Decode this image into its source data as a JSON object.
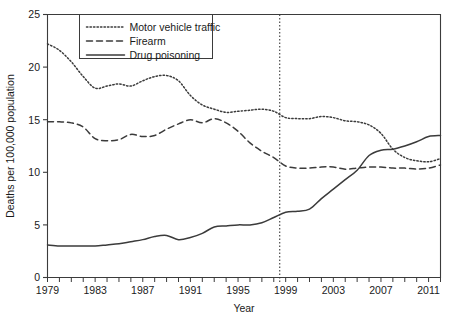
{
  "chart_data": {
    "type": "line",
    "title": "",
    "xlabel": "Year",
    "ylabel": "Deaths per 100,000 population",
    "xlim": [
      1979,
      2012
    ],
    "ylim": [
      0,
      25
    ],
    "yticks": [
      0,
      5,
      10,
      15,
      20,
      25
    ],
    "xticks": [
      1979,
      1983,
      1987,
      1991,
      1995,
      1999,
      2003,
      2007,
      2011
    ],
    "xtick_minor_step": 1,
    "grid": false,
    "legend_position": "top-left-inside",
    "annotations": [
      {
        "type": "vertical-reference-line",
        "x": 1998.5,
        "style": "dotted",
        "label": ""
      }
    ],
    "x": [
      1979,
      1980,
      1981,
      1982,
      1983,
      1984,
      1985,
      1986,
      1987,
      1988,
      1989,
      1990,
      1991,
      1992,
      1993,
      1994,
      1995,
      1996,
      1997,
      1998,
      1999,
      2000,
      2001,
      2002,
      2003,
      2004,
      2005,
      2006,
      2007,
      2008,
      2009,
      2010,
      2011,
      2012
    ],
    "series": [
      {
        "name": "Motor vehicle traffic",
        "style": "dotted",
        "values": [
          22.2,
          21.6,
          20.5,
          19.1,
          18.0,
          18.2,
          18.4,
          18.2,
          18.7,
          19.1,
          19.2,
          18.7,
          17.3,
          16.4,
          16.0,
          15.7,
          15.8,
          15.9,
          16.0,
          15.8,
          15.2,
          15.1,
          15.1,
          15.3,
          15.2,
          14.9,
          14.8,
          14.5,
          13.7,
          12.2,
          11.4,
          11.1,
          11.0,
          11.3
        ]
      },
      {
        "name": "Firearm",
        "style": "dashed",
        "values": [
          14.8,
          14.8,
          14.7,
          14.3,
          13.2,
          13.0,
          13.1,
          13.6,
          13.4,
          13.5,
          14.1,
          14.6,
          15.0,
          14.7,
          15.1,
          14.7,
          13.9,
          12.8,
          12.0,
          11.4,
          10.6,
          10.4,
          10.4,
          10.5,
          10.5,
          10.3,
          10.4,
          10.5,
          10.5,
          10.4,
          10.4,
          10.3,
          10.4,
          10.7
        ]
      },
      {
        "name": "Drug poisoning",
        "style": "solid",
        "values": [
          3.1,
          3.0,
          3.0,
          3.0,
          3.0,
          3.1,
          3.2,
          3.4,
          3.6,
          3.9,
          4.0,
          3.6,
          3.8,
          4.2,
          4.8,
          4.9,
          5.0,
          5.0,
          5.2,
          5.7,
          6.2,
          6.3,
          6.5,
          7.5,
          8.4,
          9.3,
          10.2,
          11.6,
          12.1,
          12.2,
          12.5,
          12.9,
          13.4,
          13.5
        ]
      }
    ]
  },
  "axes": {
    "ylabel": "Deaths per 100,000 population",
    "xlabel": "Year",
    "ytick_labels": [
      "0",
      "5",
      "10",
      "15",
      "20",
      "25"
    ],
    "xtick_labels": [
      "1979",
      "1983",
      "1987",
      "1991",
      "1995",
      "1999",
      "2003",
      "2007",
      "2011"
    ]
  },
  "legend": {
    "entries": [
      {
        "label": "Motor vehicle traffic"
      },
      {
        "label": "Firearm"
      },
      {
        "label": "Drug poisoning"
      }
    ]
  },
  "colors": {
    "line": "#3b3b3b",
    "text": "#1a1a1a",
    "background": "#ffffff"
  }
}
